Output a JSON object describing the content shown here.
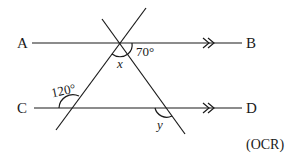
{
  "diagram": {
    "type": "parallel lines cut by two transversals",
    "points": {
      "A": "A",
      "B": "B",
      "C": "C",
      "D": "D"
    },
    "angles": {
      "top_right": "70°",
      "bottom_left": "120°",
      "unknown_x": "x",
      "unknown_y": "y"
    },
    "source": "(OCR)",
    "parallel_marker": "double arrow"
  }
}
